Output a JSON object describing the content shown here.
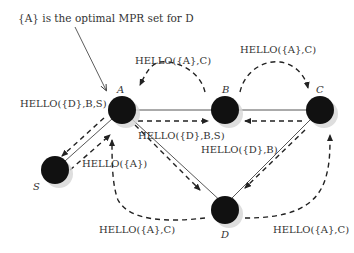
{
  "annotation": "{A} is the optimal MPR set for D",
  "nodes": {
    "A": {
      "label": "A"
    },
    "B": {
      "label": "B"
    },
    "C": {
      "label": "C"
    },
    "S": {
      "label": "S"
    },
    "D": {
      "label": "D"
    }
  },
  "messages": {
    "a_to_s": "HELLO({D},B,S)",
    "b_to_a": "HELLO({A},C)",
    "b_to_c": "HELLO({A},C)",
    "a_to_b": "HELLO({D},B,S)",
    "c_to_b_d": "HELLO({D},B)",
    "s_to_a": "HELLO({A})",
    "d_to_a": "HELLO({A},C)",
    "d_to_c": "HELLO({A},C)"
  },
  "colors": {
    "node": "#111111",
    "edge": "#333333",
    "shadow": "#cccccc"
  }
}
